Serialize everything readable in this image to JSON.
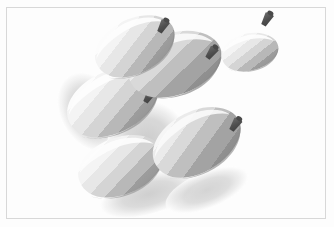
{
  "scene": {
    "title": "Toon-shaded gourd cluster render",
    "render_style": "cel-shaded / quantized bands",
    "background_color": "#fdfdfd",
    "frame_border_color": "#d8d8d8",
    "frame_rect": {
      "x": 6,
      "y": 7,
      "width": 320,
      "height": 212
    },
    "canvas_size": {
      "width": 334,
      "height": 227
    },
    "light_direction": "upper-left",
    "object_count": 5,
    "stem_count": 5
  },
  "palette": {
    "highlight": "#fbfbfb",
    "band_light": "#f2f2f2",
    "band_mid_light": "#e4e4e4",
    "band_mid": "#d2d2d2",
    "band_dark": "#b4b4b4",
    "band_shadow": "#9a9a9a",
    "core_shadow": "#8f8f8f",
    "cast_shadow": "#c9c9c9",
    "cast_shadow_soft": "#dedede",
    "stem_dark": "#4a4a4a",
    "stem_mid": "#6b6b6b",
    "outline": "#bdbdbd"
  },
  "objects": [
    {
      "id": "gourd-top-right",
      "label": "small round gourd",
      "center": {
        "x": 249,
        "y": 49
      },
      "radius_x": 23,
      "radius_y": 23,
      "rotation_deg": -12,
      "scale": 0.62,
      "stem": {
        "x": 262,
        "y": 23,
        "angle_deg": 28,
        "length": 13
      },
      "has_cast_shadow": false
    },
    {
      "id": "gourd-upper-middle",
      "label": "wide flattened gourd",
      "center": {
        "x": 172,
        "y": 63
      },
      "radius_x": 46,
      "radius_y": 30,
      "rotation_deg": -18,
      "scale": 1.0,
      "stem": {
        "x": 206,
        "y": 58,
        "angle_deg": 34,
        "length": 14
      },
      "has_cast_shadow": true
    },
    {
      "id": "gourd-upper-left",
      "label": "upper-left gourd",
      "center": {
        "x": 134,
        "y": 44
      },
      "radius_x": 38,
      "radius_y": 26,
      "rotation_deg": -26,
      "scale": 0.92,
      "stem": {
        "x": 158,
        "y": 30,
        "angle_deg": 30,
        "length": 13
      },
      "has_cast_shadow": true
    },
    {
      "id": "gourd-center-left",
      "label": "center-left large gourd",
      "center": {
        "x": 112,
        "y": 100
      },
      "radius_x": 48,
      "radius_y": 32,
      "rotation_deg": -24,
      "scale": 1.05,
      "stem": {
        "x": 140,
        "y": 98,
        "angle_deg": 30,
        "length": 13
      },
      "has_cast_shadow": true
    },
    {
      "id": "gourd-lower-right",
      "label": "lower-right gourd",
      "center": {
        "x": 196,
        "y": 141
      },
      "radius_x": 44,
      "radius_y": 31,
      "rotation_deg": -28,
      "scale": 1.0,
      "stem": {
        "x": 230,
        "y": 128,
        "angle_deg": 32,
        "length": 13
      },
      "has_cast_shadow": true
    },
    {
      "id": "gourd-bottom-left",
      "label": "bottom-left gourd",
      "center": {
        "x": 120,
        "y": 165
      },
      "radius_x": 44,
      "radius_y": 30,
      "rotation_deg": -22,
      "scale": 1.0,
      "stem": {
        "x": 152,
        "y": 155,
        "angle_deg": 30,
        "length": 13
      },
      "has_cast_shadow": true
    }
  ],
  "cast_shadows": [
    {
      "id": "shadow-left",
      "cx": 95,
      "cy": 110,
      "rx": 34,
      "ry": 44,
      "rotation_deg": -28
    },
    {
      "id": "shadow-center",
      "cx": 150,
      "cy": 140,
      "rx": 40,
      "ry": 40,
      "rotation_deg": -30
    },
    {
      "id": "shadow-bottom",
      "cx": 150,
      "cy": 190,
      "rx": 48,
      "ry": 22,
      "rotation_deg": -18
    },
    {
      "id": "shadow-lower-right",
      "cx": 205,
      "cy": 185,
      "rx": 42,
      "ry": 18,
      "rotation_deg": -22
    }
  ]
}
